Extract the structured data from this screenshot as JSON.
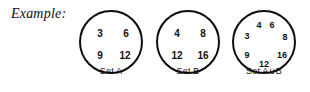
{
  "figure": {
    "example_label": "Example:",
    "background_color": "#ffffff",
    "stroke_color": "#0d0d0d",
    "text_color": "#111111"
  },
  "sets": [
    {
      "id": "set-a",
      "label": "Set A",
      "elements": [
        {
          "value": "3",
          "x": 19,
          "y": 22,
          "size": 10
        },
        {
          "value": "6",
          "x": 45,
          "y": 22,
          "size": 10
        },
        {
          "value": "9",
          "x": 19,
          "y": 44,
          "size": 10
        },
        {
          "value": "12",
          "x": 44,
          "y": 44,
          "size": 10
        }
      ]
    },
    {
      "id": "set-b",
      "label": "Set B",
      "elements": [
        {
          "value": "4",
          "x": 19,
          "y": 22,
          "size": 10
        },
        {
          "value": "8",
          "x": 45,
          "y": 22,
          "size": 10
        },
        {
          "value": "12",
          "x": 19,
          "y": 44,
          "size": 10
        },
        {
          "value": "16",
          "x": 45,
          "y": 44,
          "size": 10
        }
      ]
    },
    {
      "id": "set-a-union-b",
      "label": "Set A∪B",
      "elements": [
        {
          "value": "4",
          "x": 25,
          "y": 13,
          "size": 9
        },
        {
          "value": "6",
          "x": 38,
          "y": 13,
          "size": 9
        },
        {
          "value": "3",
          "x": 13,
          "y": 24,
          "size": 9
        },
        {
          "value": "8",
          "x": 51,
          "y": 25,
          "size": 9
        },
        {
          "value": "9",
          "x": 13,
          "y": 43,
          "size": 9
        },
        {
          "value": "16",
          "x": 48,
          "y": 43,
          "size": 9
        },
        {
          "value": "12",
          "x": 30,
          "y": 52,
          "size": 9
        }
      ]
    }
  ]
}
